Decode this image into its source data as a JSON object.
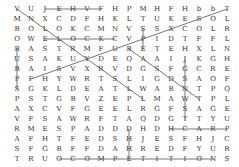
{
  "puzzle": {
    "type": "word-search",
    "rows": 16,
    "cols": 16,
    "grid": [
      "VUJEHVFHPMHFHbbT",
      "MNXCDFHKLTUKESOL",
      "BOLOKCMNVSSXCOLR",
      "OWELOCKCVPIDTFFL",
      "BASTRMFUBETEHXLN",
      "USAKUYDEQAAIJKGH",
      "BAISVXRVDGSFGCRE",
      "PFHYWRTSLIGDSAOF",
      "SGKLDEATLWABNTPQ",
      "PSTGBVZEPLMAWTPL",
      "AXCVFGEELRGFSAGE",
      "VFSAWRFTAQDGTTYU",
      "RMESPADDDHDHCARP",
      "AFHTFEDSHJESFHJC",
      "SFGBFFDAHREDFYUR",
      "TRUOCOMPETITIONS"
    ],
    "found_lines": [
      {
        "r1": 0,
        "c1": 0,
        "r2": 9,
        "c2": 9
      },
      {
        "r1": 0,
        "c1": 2,
        "r2": 0,
        "c2": 6
      },
      {
        "r1": 0,
        "c1": 15,
        "r2": 7,
        "c2": 1
      },
      {
        "r1": 3,
        "c1": 2,
        "r2": 3,
        "c2": 7
      },
      {
        "r1": 2,
        "c1": 9,
        "r2": 4,
        "c2": 9
      },
      {
        "r1": 4,
        "c1": 0,
        "r2": 8,
        "c2": 0
      },
      {
        "r1": 5,
        "c1": 12,
        "r2": 11,
        "c2": 12
      },
      {
        "r1": 12,
        "c1": 8,
        "r2": 15,
        "c2": 8
      },
      {
        "r1": 12,
        "c1": 11,
        "r2": 12,
        "c2": 15
      },
      {
        "r1": 15,
        "c1": 3,
        "r2": 15,
        "c2": 14
      },
      {
        "r1": 4,
        "c1": 8,
        "r2": 9,
        "c2": 13
      }
    ]
  }
}
